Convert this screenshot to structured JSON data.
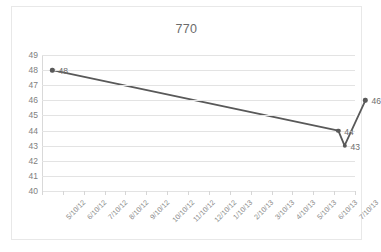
{
  "chart_data": {
    "type": "line",
    "title": "770",
    "xlabel": "",
    "ylabel": "",
    "ylim": [
      40,
      49
    ],
    "yticks": [
      40,
      41,
      42,
      43,
      44,
      45,
      46,
      47,
      48,
      49
    ],
    "grid": true,
    "legend": "none",
    "categories": [
      "5/10/12",
      "6/10/12",
      "7/10/12",
      "8/10/12",
      "9/10/12",
      "10/10/12",
      "11/10/12",
      "12/10/12",
      "1/10/13",
      "2/10/13",
      "3/10/13",
      "4/10/13",
      "5/10/13",
      "6/10/13",
      "7/10/13"
    ],
    "series": [
      {
        "name": "770",
        "points": [
          {
            "category": "5/10/12",
            "x": 0,
            "value": 48,
            "label": "48"
          },
          {
            "category": "7/10/13",
            "x": 13.7,
            "value": 44,
            "label": "44"
          },
          {
            "category": "7/10/13",
            "x": 14.0,
            "value": 43,
            "label": "43"
          },
          {
            "category": "",
            "x": 15.0,
            "value": 46,
            "label": "46"
          }
        ]
      }
    ]
  },
  "style": {
    "line_color": "#595959",
    "marker_color": "#595959",
    "grid_color": "#e3e3e3",
    "axis_color": "#d0d0d0",
    "tick_label_color": "#808080",
    "title_color": "#6b6b6b",
    "frame_color": "#e8e8e8",
    "background": "#ffffff"
  }
}
